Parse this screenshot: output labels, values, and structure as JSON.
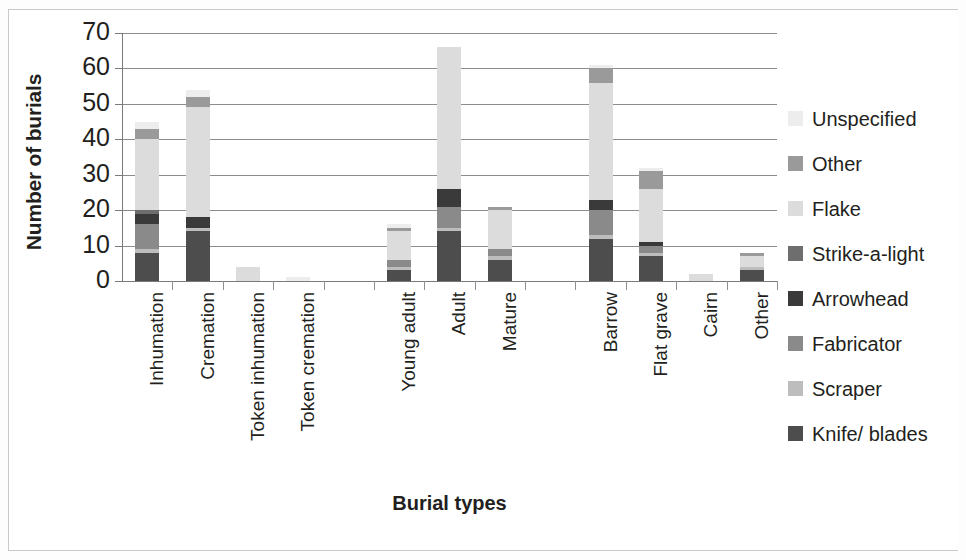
{
  "chart_data": {
    "type": "bar",
    "stacked": true,
    "title": "",
    "xlabel": "Burial types",
    "ylabel": "Number of burials",
    "ylim": [
      0,
      70
    ],
    "ytick_step": 10,
    "yticks": [
      "70",
      "60",
      "50",
      "40",
      "30",
      "20",
      "10",
      "0"
    ],
    "grid": true,
    "legend_position": "right",
    "categories": [
      "Inhumation",
      "Cremation",
      "Token inhumation",
      "Token cremation",
      "",
      "Young adult",
      "Adult",
      "Mature",
      "",
      "Barrow",
      "Flat grave",
      "Cairn",
      "Other"
    ],
    "series": [
      {
        "name": "Knife/ blades",
        "color": "#4d4d4d",
        "values": [
          8,
          14,
          0,
          0,
          0,
          3,
          14,
          6,
          0,
          12,
          7,
          0,
          3
        ]
      },
      {
        "name": "Scraper",
        "color": "#bdbdbd",
        "values": [
          1,
          1,
          0,
          0,
          0,
          1,
          1,
          1,
          0,
          1,
          1,
          0,
          1
        ]
      },
      {
        "name": "Fabricator",
        "color": "#8a8a8a",
        "values": [
          7,
          0,
          0,
          0,
          0,
          2,
          6,
          2,
          0,
          7,
          2,
          0,
          0
        ]
      },
      {
        "name": "Arrowhead",
        "color": "#3a3a3a",
        "values": [
          3,
          3,
          0,
          0,
          0,
          0,
          5,
          0,
          0,
          3,
          1,
          0,
          0
        ]
      },
      {
        "name": "Strike-a-light",
        "color": "#6e6e6e",
        "values": [
          1,
          0,
          0,
          0,
          0,
          0,
          0,
          0,
          0,
          0,
          0,
          0,
          0
        ]
      },
      {
        "name": "Flake",
        "color": "#dcdcdc",
        "values": [
          20,
          31,
          4,
          0,
          0,
          8,
          40,
          11,
          0,
          33,
          15,
          2,
          3
        ]
      },
      {
        "name": "Other",
        "color": "#9a9a9a",
        "values": [
          3,
          3,
          0,
          0,
          0,
          1,
          0,
          1,
          0,
          4,
          5,
          0,
          1
        ]
      },
      {
        "name": "Unspecified",
        "color": "#ededed",
        "values": [
          2,
          2,
          0,
          1,
          0,
          1,
          0,
          0,
          0,
          1,
          1,
          0,
          0
        ]
      }
    ],
    "totals": [
      45,
      54,
      4,
      1,
      0,
      16,
      66,
      21,
      0,
      61,
      32,
      2,
      8
    ]
  },
  "legend": {
    "items": [
      {
        "label": "Unspecified",
        "color": "#ededed"
      },
      {
        "label": "Other",
        "color": "#9a9a9a"
      },
      {
        "label": "Flake",
        "color": "#dcdcdc"
      },
      {
        "label": "Strike-a-light",
        "color": "#6e6e6e"
      },
      {
        "label": "Arrowhead",
        "color": "#3a3a3a"
      },
      {
        "label": "Fabricator",
        "color": "#8a8a8a"
      },
      {
        "label": "Scraper",
        "color": "#bdbdbd"
      },
      {
        "label": "Knife/ blades",
        "color": "#4d4d4d"
      }
    ]
  }
}
